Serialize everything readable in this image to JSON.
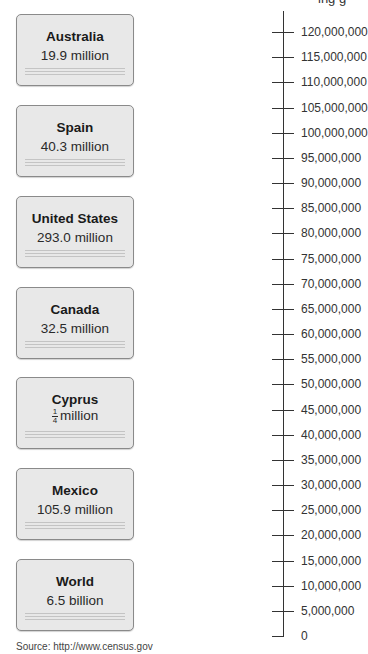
{
  "header": {
    "cut_off_text": "ing g"
  },
  "cards": [
    {
      "name": "Australia",
      "value": "19.9 million"
    },
    {
      "name": "Spain",
      "value": "40.3 million"
    },
    {
      "name": "United States",
      "value": "293.0 million"
    },
    {
      "name": "Canada",
      "value": "32.5 million"
    },
    {
      "name": "Cyprus",
      "value_fraction_num": "1",
      "value_fraction_den": "4",
      "value_unit": "million"
    },
    {
      "name": "Mexico",
      "value": "105.9 million"
    },
    {
      "name": "World",
      "value": "6.5 billion"
    }
  ],
  "number_line": {
    "ticks": [
      "120,000,000",
      "115,000,000",
      "110,000,000",
      "105,000,000",
      "100,000,000",
      "95,000,000",
      "90,000,000",
      "85,000,000",
      "80,000,000",
      "75,000,000",
      "70,000,000",
      "65,000,000",
      "60,000,000",
      "55,000,000",
      "50,000,000",
      "45,000,000",
      "40,000,000",
      "35,000,000",
      "30,000,000",
      "25,000,000",
      "20,000,000",
      "15,000,000",
      "10,000,000",
      "5,000,000",
      "0"
    ],
    "min": 0,
    "max": 120000000,
    "step": 5000000
  },
  "source": "Source: http://www.census.gov",
  "chart_data": {
    "type": "table",
    "title": "",
    "categories": [
      "Australia",
      "Spain",
      "United States",
      "Canada",
      "Cyprus",
      "Mexico",
      "World"
    ],
    "values": [
      19900000,
      40300000,
      293000000,
      32500000,
      250000,
      105900000,
      6500000000
    ],
    "value_labels": [
      "19.9 million",
      "40.3 million",
      "293.0 million",
      "32.5 million",
      "1/4 million",
      "105.9 million",
      "6.5 billion"
    ],
    "axis": {
      "orientation": "vertical",
      "range": [
        0,
        120000000
      ],
      "tick_step": 5000000
    },
    "source": "Source: http://www.census.gov"
  }
}
